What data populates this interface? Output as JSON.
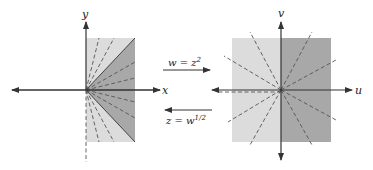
{
  "left_plane": {
    "axis_x_label": "x",
    "axis_y_label": "y",
    "region": "right half-plane Re z >= 0",
    "colors": {
      "light": "#dcdcdc",
      "dark": "#a8a8a8"
    }
  },
  "right_plane": {
    "axis_u_label": "u",
    "axis_v_label": "v",
    "region": "full w-plane (cut along negative u-axis)",
    "colors": {
      "light": "#dcdcdc",
      "dark": "#a8a8a8"
    }
  },
  "mappings": {
    "forward": {
      "label_lhs": "w = z",
      "label_exp": "2",
      "direction": "right"
    },
    "inverse": {
      "label_lhs": "z = w",
      "label_exp": "1/2",
      "direction": "left"
    }
  }
}
